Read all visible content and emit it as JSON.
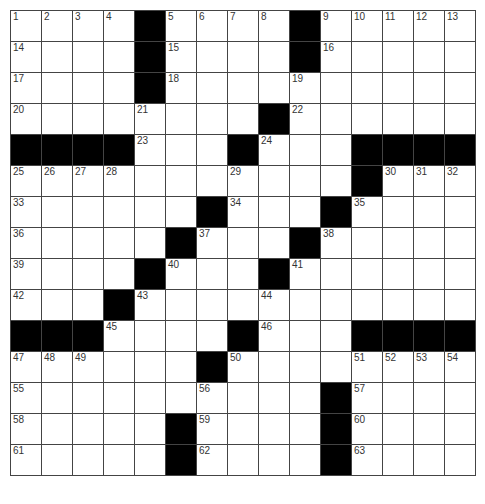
{
  "puzzle": {
    "rows": 15,
    "cols": 15,
    "colors": {
      "block": "#000000",
      "cell": "#ffffff",
      "grid_line": "#444444",
      "number_text": "#333333"
    },
    "grid": [
      [
        "1",
        "2",
        "3",
        "4",
        "#",
        "5",
        "6",
        "7",
        "8",
        "#",
        "9",
        "10",
        "11",
        "12",
        "13"
      ],
      [
        "14",
        "",
        "",
        "",
        "#",
        "15",
        "",
        "",
        "",
        "#",
        "16",
        "",
        "",
        "",
        ""
      ],
      [
        "17",
        "",
        "",
        "",
        "#",
        "18",
        "",
        "",
        "",
        "19",
        "",
        "",
        "",
        "",
        ""
      ],
      [
        "20",
        "",
        "",
        "",
        "21",
        "",
        "",
        "",
        "#",
        "22",
        "",
        "",
        "",
        "",
        ""
      ],
      [
        "#",
        "#",
        "#",
        "#",
        "23",
        "",
        "",
        "#",
        "24",
        "",
        "",
        "#",
        "#",
        "#",
        "#"
      ],
      [
        "25",
        "26",
        "27",
        "28",
        "",
        "",
        "",
        "29",
        "",
        "",
        "",
        "#",
        "30",
        "31",
        "32"
      ],
      [
        "33",
        "",
        "",
        "",
        "",
        "",
        "#",
        "34",
        "",
        "",
        "#",
        "35",
        "",
        "",
        ""
      ],
      [
        "36",
        "",
        "",
        "",
        "",
        "#",
        "37",
        "",
        "",
        "#",
        "38",
        "",
        "",
        "",
        ""
      ],
      [
        "39",
        "",
        "",
        "",
        "#",
        "40",
        "",
        "",
        "#",
        "41",
        "",
        "",
        "",
        "",
        ""
      ],
      [
        "42",
        "",
        "",
        "#",
        "43",
        "",
        "",
        "",
        "44",
        "",
        "",
        "",
        "",
        "",
        ""
      ],
      [
        "#",
        "#",
        "#",
        "45",
        "",
        "",
        "",
        "#",
        "46",
        "",
        "",
        "#",
        "#",
        "#",
        "#"
      ],
      [
        "47",
        "48",
        "49",
        "",
        "",
        "",
        "#",
        "50",
        "",
        "",
        "",
        "51",
        "52",
        "53",
        "54"
      ],
      [
        "55",
        "",
        "",
        "",
        "",
        "",
        "56",
        "",
        "",
        "",
        "#",
        "57",
        "",
        "",
        ""
      ],
      [
        "58",
        "",
        "",
        "",
        "",
        "#",
        "59",
        "",
        "",
        "",
        "#",
        "60",
        "",
        "",
        ""
      ],
      [
        "61",
        "",
        "",
        "",
        "",
        "#",
        "62",
        "",
        "",
        "",
        "#",
        "63",
        "",
        "",
        ""
      ]
    ]
  }
}
